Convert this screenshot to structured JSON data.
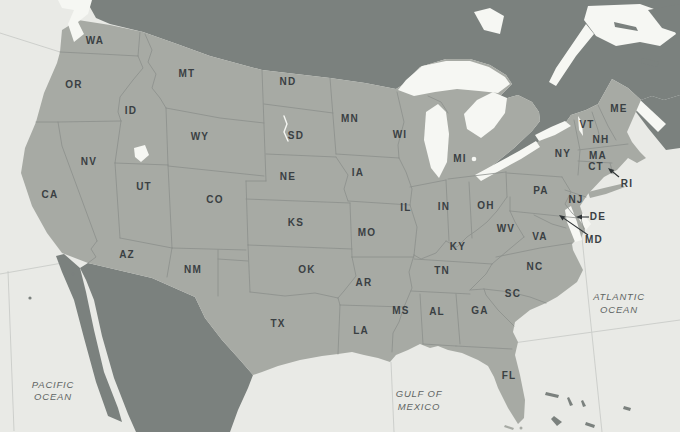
{
  "map": {
    "region_name": "United States",
    "colors": {
      "ocean": "#e9eae6",
      "lakes": "#f6f7f3",
      "us_land": "#a7aaa4",
      "foreign_land": "#7b817e",
      "state_border": "#8b8f8b",
      "graticule": "#c9ccc8",
      "state_label": "#3a4043",
      "ocean_label": "#5f6564",
      "arrow": "#2e3335"
    },
    "states": [
      {
        "abbr": "WA",
        "x": 95,
        "y": 40
      },
      {
        "abbr": "OR",
        "x": 74,
        "y": 84
      },
      {
        "abbr": "ID",
        "x": 131,
        "y": 110
      },
      {
        "abbr": "MT",
        "x": 187,
        "y": 73
      },
      {
        "abbr": "WY",
        "x": 200,
        "y": 136
      },
      {
        "abbr": "NV",
        "x": 89,
        "y": 161
      },
      {
        "abbr": "UT",
        "x": 144,
        "y": 186
      },
      {
        "abbr": "CA",
        "x": 50,
        "y": 194
      },
      {
        "abbr": "AZ",
        "x": 127,
        "y": 254
      },
      {
        "abbr": "NM",
        "x": 193,
        "y": 269
      },
      {
        "abbr": "CO",
        "x": 215,
        "y": 199
      },
      {
        "abbr": "ND",
        "x": 288,
        "y": 81
      },
      {
        "abbr": "SD",
        "x": 296,
        "y": 135
      },
      {
        "abbr": "NE",
        "x": 288,
        "y": 176
      },
      {
        "abbr": "KS",
        "x": 296,
        "y": 222
      },
      {
        "abbr": "OK",
        "x": 307,
        "y": 269
      },
      {
        "abbr": "TX",
        "x": 278,
        "y": 323
      },
      {
        "abbr": "MN",
        "x": 350,
        "y": 118
      },
      {
        "abbr": "IA",
        "x": 358,
        "y": 172
      },
      {
        "abbr": "MO",
        "x": 367,
        "y": 232
      },
      {
        "abbr": "AR",
        "x": 364,
        "y": 282
      },
      {
        "abbr": "LA",
        "x": 361,
        "y": 330
      },
      {
        "abbr": "WI",
        "x": 400,
        "y": 134
      },
      {
        "abbr": "IL",
        "x": 406,
        "y": 207
      },
      {
        "abbr": "IN",
        "x": 444,
        "y": 206
      },
      {
        "abbr": "MI",
        "x": 460,
        "y": 158
      },
      {
        "abbr": "OH",
        "x": 486,
        "y": 205
      },
      {
        "abbr": "KY",
        "x": 458,
        "y": 246
      },
      {
        "abbr": "TN",
        "x": 442,
        "y": 270
      },
      {
        "abbr": "MS",
        "x": 401,
        "y": 310
      },
      {
        "abbr": "AL",
        "x": 437,
        "y": 311
      },
      {
        "abbr": "GA",
        "x": 480,
        "y": 310
      },
      {
        "abbr": "FL",
        "x": 509,
        "y": 375
      },
      {
        "abbr": "SC",
        "x": 513,
        "y": 293
      },
      {
        "abbr": "NC",
        "x": 535,
        "y": 266
      },
      {
        "abbr": "VA",
        "x": 540,
        "y": 236
      },
      {
        "abbr": "WV",
        "x": 506,
        "y": 228
      },
      {
        "abbr": "PA",
        "x": 541,
        "y": 190
      },
      {
        "abbr": "NY",
        "x": 563,
        "y": 153
      },
      {
        "abbr": "NJ",
        "x": 576,
        "y": 199
      },
      {
        "abbr": "VT",
        "x": 587,
        "y": 124
      },
      {
        "abbr": "NH",
        "x": 601,
        "y": 139
      },
      {
        "abbr": "MA",
        "x": 598,
        "y": 155
      },
      {
        "abbr": "CT",
        "x": 596,
        "y": 166
      },
      {
        "abbr": "ME",
        "x": 619,
        "y": 108
      },
      {
        "abbr": "RI",
        "x": 627,
        "y": 183
      },
      {
        "abbr": "DE",
        "x": 598,
        "y": 216
      },
      {
        "abbr": "MD",
        "x": 594,
        "y": 239
      }
    ],
    "callouts": [
      {
        "abbr": "RI",
        "tail_x": 619,
        "tail_y": 177,
        "tip_x": 608,
        "tip_y": 168
      },
      {
        "abbr": "DE",
        "tail_x": 589,
        "tail_y": 217,
        "tip_x": 576,
        "tip_y": 217
      },
      {
        "abbr": "MD",
        "tail_x": 588,
        "tail_y": 235,
        "tip_x": 559,
        "tip_y": 215
      }
    ],
    "ocean_labels": [
      {
        "id": "pacific-ocean",
        "lines": [
          "PACIFIC",
          "OCEAN"
        ],
        "x": 53,
        "y": 388,
        "line_height": 12
      },
      {
        "id": "atlantic-ocean",
        "lines": [
          "ATLANTIC",
          "OCEAN"
        ],
        "x": 619,
        "y": 300,
        "line_height": 13
      },
      {
        "id": "gulf-of-mexico",
        "lines": [
          "GULF OF",
          "MEXICO"
        ],
        "x": 419,
        "y": 397,
        "line_height": 13
      }
    ]
  }
}
